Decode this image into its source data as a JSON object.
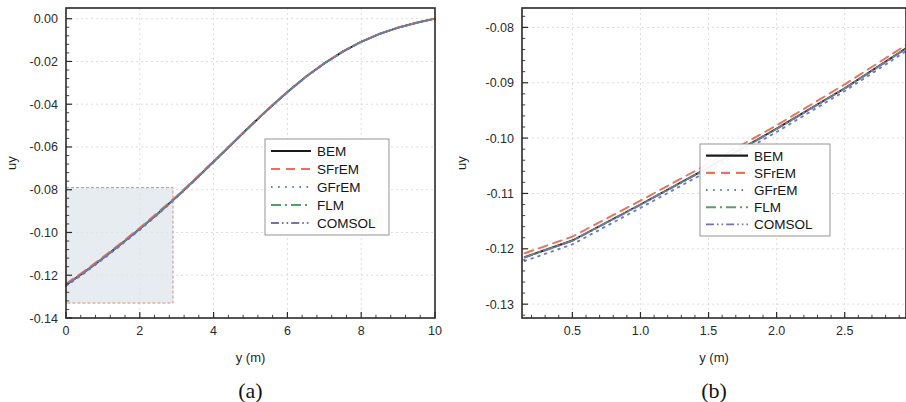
{
  "figure": {
    "background": "#ffffff",
    "panels": [
      "a",
      "b"
    ]
  },
  "series_style": {
    "BEM": {
      "color": "#1a1a1a",
      "dash": "none",
      "width": 1.9
    },
    "SFrEM": {
      "color": "#e8735c",
      "dash": "9 6",
      "width": 1.9
    },
    "GFrEM": {
      "color": "#6a7fb5",
      "dash": "1.6 5.5",
      "width": 1.9
    },
    "FLM": {
      "color": "#57a06a",
      "dash": "10 4 2 4",
      "width": 1.6
    },
    "COMSOL": {
      "color": "#7d6fae",
      "dash": "8 3 1.6 3 1.6 3",
      "width": 1.6
    }
  },
  "panel_a": {
    "caption": "(a)",
    "xlabel": "y (m)",
    "ylabel": "uy",
    "xticks": [
      "0",
      "2",
      "4",
      "6",
      "8",
      "10"
    ],
    "yticks": [
      "0.00",
      "-0.02",
      "-0.04",
      "-0.06",
      "-0.08",
      "-0.10",
      "-0.12",
      "-0.14"
    ],
    "xlim": [
      0,
      10
    ],
    "ylim": [
      -0.14,
      0.005
    ],
    "legend": [
      "BEM",
      "SFrEM",
      "GFrEM",
      "FLM",
      "COMSOL"
    ],
    "inset_region": {
      "x0": 0.0,
      "x1": 2.9,
      "y0": -0.133,
      "y1": -0.079
    }
  },
  "panel_b": {
    "caption": "(b)",
    "xlabel": "y (m)",
    "ylabel": "uy",
    "xticks": [
      "0.5",
      "1.0",
      "1.5",
      "2.0",
      "2.5"
    ],
    "yticks": [
      "-0.08",
      "-0.09",
      "-0.10",
      "-0.11",
      "-0.12",
      "-0.13"
    ],
    "xlim": [
      0.13,
      2.95
    ],
    "ylim": [
      -0.1325,
      -0.0765
    ],
    "legend": [
      "BEM",
      "SFrEM",
      "GFrEM",
      "FLM",
      "COMSOL"
    ]
  },
  "chart_data": [
    {
      "type": "line",
      "panel": "(a)",
      "title": "",
      "xlabel": "y (m)",
      "ylabel": "uy",
      "xlim": [
        0,
        10
      ],
      "ylim": [
        -0.14,
        0.005
      ],
      "xticks": [
        0,
        2,
        4,
        6,
        8,
        10
      ],
      "yticks": [
        0.0,
        -0.02,
        -0.04,
        -0.06,
        -0.08,
        -0.1,
        -0.12,
        -0.14
      ],
      "grid": true,
      "legend_position": "center-right",
      "annotation": "shaded zoom region x=[0,2.9], y=[-0.133,-0.079] outlined with dashed salmon border, indicating region magnified in panel (b)",
      "x": [
        0,
        0.5,
        1.0,
        1.5,
        2.0,
        2.5,
        3.0,
        3.5,
        4.0,
        4.5,
        5.0,
        5.5,
        6.0,
        6.5,
        7.0,
        7.5,
        8.0,
        8.5,
        9.0,
        9.5,
        10.0
      ],
      "series": [
        {
          "name": "BEM",
          "values": [
            -0.1245,
            -0.1185,
            -0.112,
            -0.1053,
            -0.0983,
            -0.091,
            -0.0833,
            -0.0752,
            -0.0669,
            -0.0585,
            -0.0501,
            -0.042,
            -0.0343,
            -0.0272,
            -0.0209,
            -0.0154,
            -0.0108,
            -0.0071,
            -0.0042,
            -0.0019,
            0.0
          ]
        },
        {
          "name": "SFrEM",
          "values": [
            -0.124,
            -0.118,
            -0.1115,
            -0.1048,
            -0.0978,
            -0.0905,
            -0.0829,
            -0.0749,
            -0.0666,
            -0.0583,
            -0.0499,
            -0.0418,
            -0.0342,
            -0.0271,
            -0.0208,
            -0.0153,
            -0.0107,
            -0.007,
            -0.0041,
            -0.0019,
            0.0
          ]
        },
        {
          "name": "GFrEM",
          "values": [
            -0.125,
            -0.119,
            -0.1125,
            -0.1058,
            -0.0988,
            -0.0914,
            -0.0837,
            -0.0755,
            -0.0671,
            -0.0587,
            -0.0503,
            -0.0421,
            -0.0344,
            -0.0273,
            -0.021,
            -0.0155,
            -0.0108,
            -0.0071,
            -0.0042,
            -0.0019,
            0.0
          ]
        },
        {
          "name": "FLM",
          "values": [
            -0.1245,
            -0.1185,
            -0.112,
            -0.1053,
            -0.0983,
            -0.091,
            -0.0833,
            -0.0752,
            -0.0669,
            -0.0585,
            -0.0501,
            -0.042,
            -0.0343,
            -0.0272,
            -0.0209,
            -0.0154,
            -0.0108,
            -0.0071,
            -0.0042,
            -0.0019,
            0.0
          ]
        },
        {
          "name": "COMSOL",
          "values": [
            -0.1246,
            -0.1186,
            -0.1121,
            -0.1054,
            -0.0984,
            -0.0911,
            -0.0834,
            -0.0753,
            -0.067,
            -0.0586,
            -0.0502,
            -0.042,
            -0.0343,
            -0.0272,
            -0.0209,
            -0.0154,
            -0.0108,
            -0.0071,
            -0.0042,
            -0.0019,
            0.0
          ]
        }
      ]
    },
    {
      "type": "line",
      "panel": "(b)",
      "title": "",
      "xlabel": "y (m)",
      "ylabel": "uy",
      "xlim": [
        0.13,
        2.95
      ],
      "ylim": [
        -0.1325,
        -0.0765
      ],
      "xticks": [
        0.5,
        1.0,
        1.5,
        2.0,
        2.5
      ],
      "yticks": [
        -0.08,
        -0.09,
        -0.1,
        -0.11,
        -0.12,
        -0.13
      ],
      "grid": true,
      "legend_position": "center-right",
      "annotation": "magnified view of shaded region in panel (a)",
      "x": [
        0.15,
        0.5,
        1.0,
        1.5,
        2.0,
        2.5,
        2.95
      ],
      "series": [
        {
          "name": "BEM",
          "values": [
            -0.1215,
            -0.1185,
            -0.112,
            -0.1053,
            -0.0983,
            -0.091,
            -0.0838
          ]
        },
        {
          "name": "SFrEM",
          "values": [
            -0.1208,
            -0.1178,
            -0.1113,
            -0.1046,
            -0.0977,
            -0.0903,
            -0.0832
          ]
        },
        {
          "name": "GFrEM",
          "values": [
            -0.1222,
            -0.1192,
            -0.1126,
            -0.1059,
            -0.0989,
            -0.0915,
            -0.0843
          ]
        },
        {
          "name": "FLM",
          "values": [
            -0.1215,
            -0.1185,
            -0.112,
            -0.1053,
            -0.0983,
            -0.091,
            -0.0838
          ]
        },
        {
          "name": "COMSOL",
          "values": [
            -0.1216,
            -0.1186,
            -0.1121,
            -0.1054,
            -0.0984,
            -0.0911,
            -0.0839
          ]
        }
      ]
    }
  ]
}
